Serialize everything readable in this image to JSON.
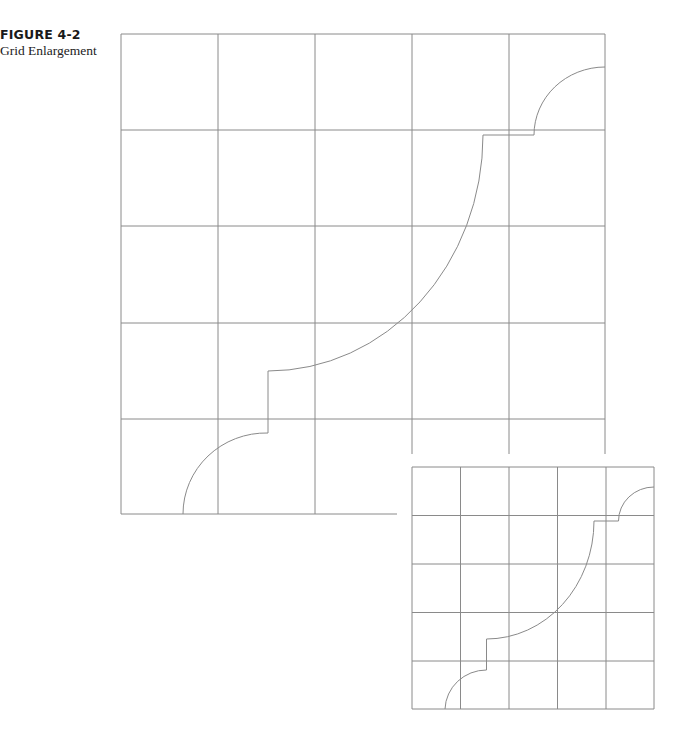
{
  "caption": {
    "figure_number": "FIGURE 4-2",
    "title": "Grid Enlargement"
  },
  "colors": {
    "line": "#8a8a8a",
    "text": "#1a1a1a",
    "background": "#ffffff"
  },
  "large_grid": {
    "columns_x": [
      121,
      218,
      315,
      412,
      509,
      605
    ],
    "rows_y": [
      34,
      130,
      226,
      323,
      419,
      514
    ],
    "cells": "5x5",
    "vertical_extents": [
      {
        "x": 121,
        "y1": 34,
        "y2": 514
      },
      {
        "x": 218,
        "y1": 34,
        "y2": 514
      },
      {
        "x": 315,
        "y1": 34,
        "y2": 514
      },
      {
        "x": 412,
        "y1": 34,
        "y2": 454
      },
      {
        "x": 509,
        "y1": 34,
        "y2": 454
      },
      {
        "x": 605,
        "y1": 34,
        "y2": 454
      }
    ],
    "horizontal_extents": [
      {
        "y": 34,
        "x1": 121,
        "x2": 605
      },
      {
        "y": 130,
        "x1": 121,
        "x2": 605
      },
      {
        "y": 226,
        "x1": 121,
        "x2": 605
      },
      {
        "y": 323,
        "x1": 121,
        "x2": 605
      },
      {
        "y": 419,
        "x1": 121,
        "x2": 605
      },
      {
        "y": 514,
        "x1": 121,
        "x2": 397
      }
    ],
    "curve_path": "M605,67 A71,68 0 0 0 534,135 L483,135 A215,236 0 0 1 268,371 L268,433 A83,81 0 0 0 183,514"
  },
  "small_grid": {
    "columns_x": [
      412,
      460.5,
      509,
      557.5,
      606,
      654
    ],
    "rows_y": [
      467,
      515.5,
      564,
      612.5,
      661,
      709
    ],
    "cells": "5x5",
    "curve_path": "M654,487 A35.5,34 0 0 0 618.5,521 L594,521 A107.5,118 0 0 1 486.5,639 L486.5,670 A41.5,40.5 0 0 0 445,709"
  }
}
